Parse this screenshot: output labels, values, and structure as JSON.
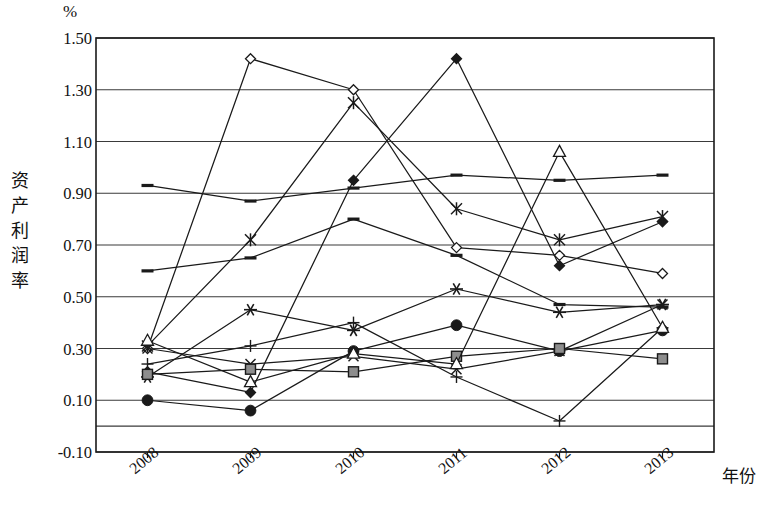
{
  "chart_data": {
    "type": "line",
    "title": "",
    "unit_label": "%",
    "ylabel": "资产利润率",
    "xlabel": "年份",
    "categories": [
      "2008",
      "2009",
      "2010",
      "2011",
      "2012",
      "2013"
    ],
    "yticks": [
      "1.50",
      "1.30",
      "1.10",
      "0.90",
      "0.70",
      "0.50",
      "0.30",
      "0.10",
      "-0.10"
    ],
    "ytick_values": [
      1.5,
      1.3,
      1.1,
      0.9,
      0.7,
      0.5,
      0.3,
      0.1,
      -0.1
    ],
    "ylim": [
      -0.1,
      1.5
    ],
    "grid": true,
    "legend": "none",
    "series": [
      {
        "name": "series-open-diamond",
        "marker": "open-diamond",
        "values": [
          0.3,
          1.42,
          1.3,
          0.69,
          0.66,
          0.59
        ]
      },
      {
        "name": "series-filled-diamond",
        "marker": "filled-diamond",
        "values": [
          0.21,
          0.13,
          0.95,
          1.42,
          0.62,
          0.79
        ]
      },
      {
        "name": "series-asterisk-star",
        "marker": "asterisk-star",
        "values": [
          0.31,
          0.72,
          1.25,
          0.84,
          0.72,
          0.81
        ]
      },
      {
        "name": "series-dash-high",
        "marker": "dash",
        "values": [
          0.93,
          0.87,
          0.92,
          0.97,
          0.95,
          0.97
        ]
      },
      {
        "name": "series-dash-low",
        "marker": "dash",
        "values": [
          0.6,
          0.65,
          0.8,
          0.66,
          0.47,
          0.46
        ]
      },
      {
        "name": "series-six-point-star",
        "marker": "six-star",
        "values": [
          0.19,
          0.45,
          0.37,
          0.53,
          0.44,
          0.47
        ]
      },
      {
        "name": "series-x-cross",
        "marker": "x-cross",
        "values": [
          0.3,
          0.24,
          0.27,
          0.22,
          0.29,
          0.47
        ]
      },
      {
        "name": "series-filled-circle",
        "marker": "filled-circle",
        "values": [
          0.1,
          0.06,
          0.29,
          0.39,
          0.29,
          0.37
        ]
      },
      {
        "name": "series-plus",
        "marker": "plus",
        "values": [
          0.24,
          0.31,
          0.4,
          0.19,
          0.02,
          0.38
        ]
      },
      {
        "name": "series-filled-square",
        "marker": "filled-square",
        "values": [
          0.2,
          0.22,
          0.21,
          0.27,
          0.3,
          0.26
        ]
      },
      {
        "name": "series-open-triangle",
        "marker": "open-triangle",
        "values": [
          0.33,
          0.17,
          0.28,
          0.24,
          1.06,
          0.38
        ]
      }
    ]
  },
  "style": {
    "line_color": "#1a1a1a",
    "grid_color": "#3a3a3a",
    "frame_color": "#1a1a1a",
    "background": "#ffffff"
  }
}
